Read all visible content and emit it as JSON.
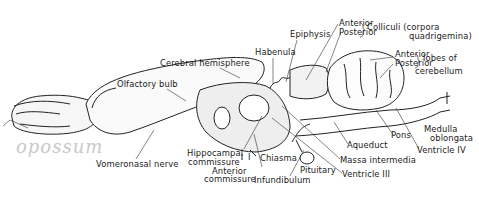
{
  "diagram": {
    "handwritten_note": "opossum",
    "labels": {
      "olfactory_bulb": "Olfactory bulb",
      "cerebral_hemisphere": "Cerebral hemisphere",
      "habenula": "Habenula",
      "epiphysis": "Epiphysis",
      "colliculi_anterior": "Anterior",
      "colliculi_posterior": "Posterior",
      "colliculi_group": "Colliculi (corpora",
      "colliculi_group_2": "quadrigemina)",
      "cerebellum_anterior": "Anterior",
      "cerebellum_posterior": "Posterior",
      "cerebellum_group": "lobes of",
      "cerebellum_group_2": "cerebellum",
      "medulla_1": "Medulla",
      "medulla_2": "oblongata",
      "pons": "Pons",
      "ventricle_iv": "Ventricle IV",
      "aqueduct": "Aqueduct",
      "massa_intermedia": "Massa intermedia",
      "ventricle_iii": "Ventricle III",
      "pituitary": "Pituitary",
      "infundibulum": "Infundibulum",
      "chiasma": "Chiasma",
      "anterior_commissure_1": "Anterior",
      "anterior_commissure_2": "commissure",
      "hippocampal_commissure_1": "Hippocampal",
      "hippocampal_commissure_2": "commissure",
      "vomeronasal_nerve": "Vomeronasal nerve",
      "roman_one": "I"
    }
  }
}
